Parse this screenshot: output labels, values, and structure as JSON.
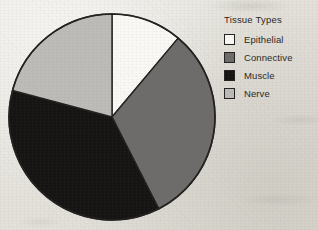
{
  "chart_data": {
    "type": "pie",
    "title": "",
    "legend_title": "Tissue Types",
    "legend_position": "right",
    "grid": false,
    "categories": [
      "Epithelial",
      "Connective",
      "Muscle",
      "Nerve"
    ],
    "values": [
      11,
      31,
      37,
      21
    ],
    "units": "percent",
    "start_angle_deg": 0,
    "direction": "clockwise",
    "slices": [
      {
        "label": "Epithelial",
        "value": 11,
        "start_deg": 0,
        "end_deg": 40,
        "sweep_deg": 40,
        "color": "#faf9f6"
      },
      {
        "label": "Connective",
        "value": 31,
        "start_deg": 40,
        "end_deg": 153,
        "sweep_deg": 113,
        "color": "#6d6c6b"
      },
      {
        "label": "Muscle",
        "value": 37,
        "start_deg": 153,
        "end_deg": 285,
        "sweep_deg": 132,
        "color": "#151413"
      },
      {
        "label": "Nerve",
        "value": 21,
        "start_deg": 285,
        "end_deg": 360,
        "sweep_deg": 75,
        "color": "#bdbcb8"
      }
    ],
    "outline_color": "#232120",
    "background_color": "#e8e6e0"
  },
  "legend": {
    "title": "Tissue Types",
    "items": [
      {
        "label": "Epithelial",
        "color": "#faf9f6"
      },
      {
        "label": "Connective",
        "color": "#6d6c6b"
      },
      {
        "label": "Muscle",
        "color": "#151413"
      },
      {
        "label": "Nerve",
        "color": "#bdbcb8"
      }
    ]
  }
}
